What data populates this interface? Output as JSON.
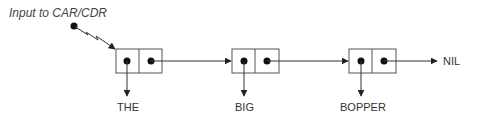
{
  "diagram": {
    "input_label": "Input to CAR/CDR",
    "cells": [
      {
        "car": "THE"
      },
      {
        "car": "BIG"
      },
      {
        "car": "BOPPER"
      }
    ],
    "terminator": "NIL",
    "colors": {
      "line": "#333333",
      "box_border": "#555555",
      "dot": "#111111"
    }
  }
}
